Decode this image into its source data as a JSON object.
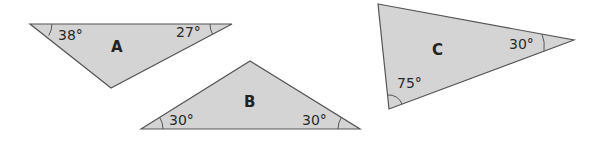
{
  "colors": {
    "fill": "#d4d4d4",
    "stroke": "#555555",
    "text": "#2a2a2a",
    "background": "#ffffff"
  },
  "triangles": [
    {
      "label": "A",
      "vertices": [
        [
          30,
          24
        ],
        [
          232,
          24
        ],
        [
          111,
          88
        ]
      ],
      "angles": [
        {
          "value": "38°",
          "vertex": 0
        },
        {
          "value": "27°",
          "vertex": 1
        }
      ]
    },
    {
      "label": "B",
      "vertices": [
        [
          141,
          129
        ],
        [
          250,
          61
        ],
        [
          360,
          129
        ]
      ],
      "angles": [
        {
          "value": "30°",
          "vertex": 0
        },
        {
          "value": "30°",
          "vertex": 2
        }
      ]
    },
    {
      "label": "C",
      "vertices": [
        [
          378,
          4
        ],
        [
          574,
          40
        ],
        [
          389,
          109
        ]
      ],
      "angles": [
        {
          "value": "30°",
          "vertex": 1
        },
        {
          "value": "75°",
          "vertex": 2
        }
      ]
    }
  ]
}
